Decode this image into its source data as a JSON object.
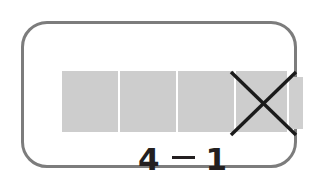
{
  "card": {
    "kind": "subtraction-model-card",
    "border_color": "#7c7c7c",
    "background_color": "#ffffff"
  },
  "model": {
    "label": "bar model",
    "block_color": "#cdcdcd",
    "separator_color": "#ffffff",
    "total_blocks": 5,
    "whole_blocks": 4,
    "crossed_out_blocks": 1,
    "blocks": [
      {
        "index": 1,
        "state": "present",
        "crossed": false
      },
      {
        "index": 2,
        "state": "present",
        "crossed": false
      },
      {
        "index": 3,
        "state": "present",
        "crossed": false
      },
      {
        "index": 4,
        "state": "present",
        "crossed": true
      },
      {
        "index": 5,
        "state": "partial",
        "crossed": false
      }
    ],
    "cross_out": {
      "color": "#1b1b1b",
      "shape": "x-mark",
      "covers_block_index": 4
    }
  },
  "equation": {
    "minuend": "4",
    "operator": "−",
    "operator_name": "minus-sign",
    "subtrahend": "1",
    "full_text": "4 − 1",
    "text_color": "#231f20"
  }
}
